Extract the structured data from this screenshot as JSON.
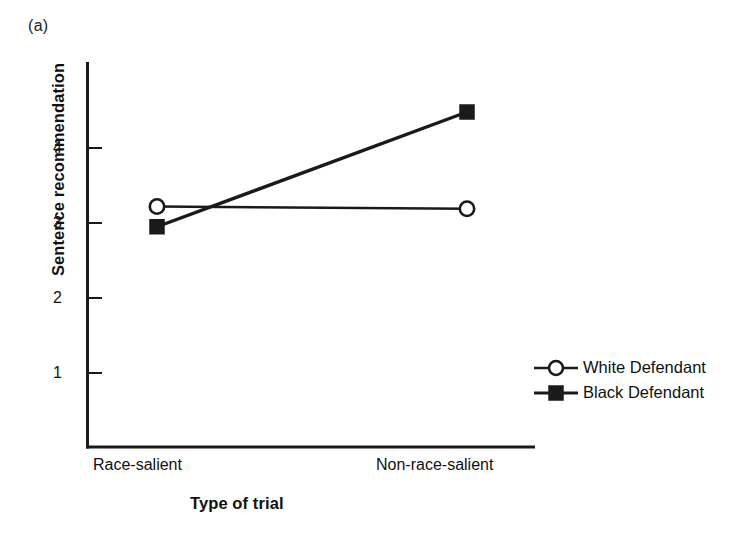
{
  "figure": {
    "panel_label": "(a)",
    "top_cut_text": " ",
    "background_color": "#ffffff",
    "ink_color": "#1a1a1a"
  },
  "chart_data": {
    "type": "line",
    "title": "",
    "subtitle": "",
    "xlabel": "Type of trial",
    "ylabel": "Sentence recommendation",
    "categories": [
      "Race-salient",
      "Non-race-salient"
    ],
    "x": [
      0,
      1
    ],
    "xtick_labels": [
      "Race-salient",
      "Non-race-salient"
    ],
    "ytick_labels": [
      "1",
      "2",
      "3",
      "4"
    ],
    "yticks": [
      1,
      2,
      3,
      4
    ],
    "ylim": [
      0.3,
      4.95
    ],
    "xlim": [
      -0.35,
      1.35
    ],
    "grid": false,
    "legend_position": "right",
    "series": [
      {
        "name": "White Defendant",
        "marker": "open-circle",
        "color": "#1a1a1a",
        "values": [
          3.22,
          3.19
        ]
      },
      {
        "name": "Black Defendant",
        "marker": "filled-square",
        "color": "#1a1a1a",
        "values": [
          2.95,
          4.48
        ]
      }
    ],
    "legend": [
      {
        "label": "White Defendant",
        "marker": "open-circle"
      },
      {
        "label": "Black Defendant",
        "marker": "filled-square"
      }
    ],
    "annotations": []
  }
}
